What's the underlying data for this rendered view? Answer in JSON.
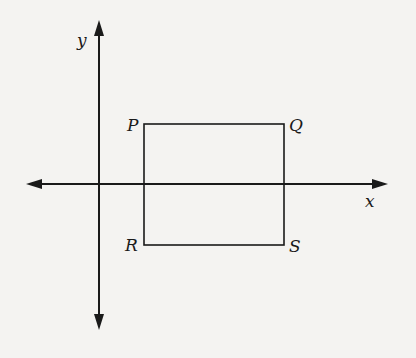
{
  "diagram": {
    "axes": {
      "x_label": "x",
      "y_label": "y"
    },
    "rectangle": {
      "vertices": [
        {
          "name": "P",
          "position": "top-left"
        },
        {
          "name": "Q",
          "position": "top-right"
        },
        {
          "name": "R",
          "position": "bottom-left"
        },
        {
          "name": "S",
          "position": "bottom-right"
        }
      ]
    },
    "colors": {
      "stroke": "#1a1a1a",
      "background": "#f4f3f1"
    }
  }
}
